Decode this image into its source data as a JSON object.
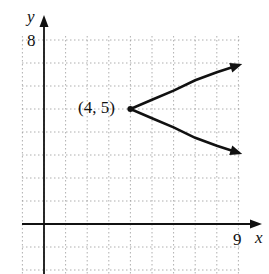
{
  "chart_data": {
    "type": "line",
    "title": "",
    "xlabel": "x",
    "ylabel": "y",
    "xlim": [
      -1,
      9
    ],
    "ylim": [
      -2,
      8
    ],
    "grid": true,
    "tick_labels": {
      "x": [
        "9"
      ],
      "y": [
        "8"
      ]
    },
    "series": [
      {
        "name": "parabola opening right",
        "equation_form": "x = 4 + k(y-5)^2",
        "vertex": [
          4,
          5
        ],
        "points": [
          [
            9.0,
            6.9
          ],
          [
            8,
            6.6
          ],
          [
            7,
            6.25
          ],
          [
            6,
            5.8
          ],
          [
            5,
            5.4
          ],
          [
            4,
            5
          ],
          [
            5,
            4.6
          ],
          [
            6,
            4.2
          ],
          [
            7,
            3.75
          ],
          [
            8,
            3.4
          ],
          [
            9.0,
            3.1
          ]
        ],
        "arrows_at_ends": true
      }
    ],
    "annotations": [
      {
        "text": "(4, 5)",
        "x": 4,
        "y": 5,
        "position": "left"
      }
    ]
  },
  "labels": {
    "y_axis": "y",
    "x_axis": "x",
    "y_max": "8",
    "x_max": "9",
    "vertex": "(4, 5)"
  }
}
